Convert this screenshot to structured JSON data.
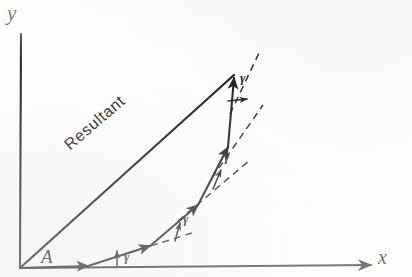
{
  "figure": {
    "kind": "vector-addition-diagram",
    "caption_text": "",
    "background_color": "#fefefe",
    "ink_color": "#1d1d1d",
    "axes": {
      "y_label": "y",
      "x_label": "x",
      "origin_label": "A",
      "x_axis_start": [
        20,
        268
      ],
      "x_axis_end": [
        371,
        265
      ],
      "y_axis_start": [
        20,
        268
      ],
      "y_axis_end": [
        21,
        34
      ],
      "x_has_arrowhead": true,
      "y_has_arrowhead": false
    },
    "resultant": {
      "label": "Resultant",
      "label_rotation_deg": -40.5,
      "start": [
        20,
        268
      ],
      "end": [
        234,
        75
      ],
      "has_arrowhead": false
    },
    "angle_label": "γ",
    "angle_labels": [
      {
        "id": "angle-1",
        "text": "γ",
        "x": 124,
        "y": 250
      },
      {
        "id": "angle-2",
        "text": "γ",
        "x": 183,
        "y": 212
      },
      {
        "id": "angle-3",
        "text": "γ",
        "x": 224,
        "y": 150
      },
      {
        "id": "angle-4",
        "text": "γ",
        "x": 240,
        "y": 71
      }
    ],
    "chain_vertices": [
      [
        20,
        268
      ],
      [
        88,
        266
      ],
      [
        150,
        246
      ],
      [
        198,
        205
      ],
      [
        228,
        146
      ],
      [
        234,
        76
      ]
    ],
    "chain_arrow_count": 5,
    "dashed_extensions": [
      {
        "from": [
          128,
          253
        ],
        "to": [
          190,
          234
        ]
      },
      {
        "from": [
          180,
          219
        ],
        "to": [
          248,
          161
        ]
      },
      {
        "from": [
          213,
          177
        ],
        "to": [
          262,
          106
        ]
      },
      {
        "from": [
          231,
          112
        ],
        "to": [
          258,
          54
        ]
      }
    ],
    "angle_ticks": [
      {
        "from": [
          117,
          265
        ],
        "to": [
          117,
          252
        ]
      },
      {
        "from": [
          175,
          240
        ],
        "to": [
          179,
          224
        ]
      },
      {
        "from": [
          214,
          188
        ],
        "to": [
          221,
          172
        ]
      },
      {
        "from": [
          228,
          103
        ],
        "to": [
          245,
          100
        ]
      }
    ]
  }
}
